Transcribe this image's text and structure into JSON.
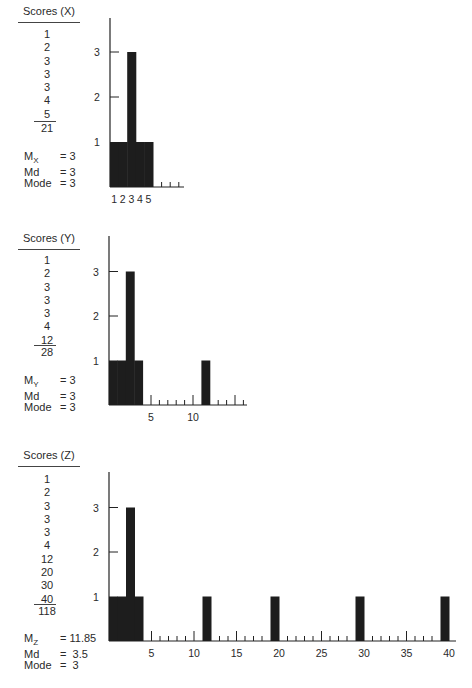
{
  "panels": [
    {
      "id": "x",
      "title": "Scores (X)",
      "scores": [
        "1",
        "2",
        "3",
        "3",
        "3",
        "4",
        "5"
      ],
      "sum": "21",
      "stats": [
        {
          "label": "M",
          "sub": "X",
          "eq": "= 3"
        },
        {
          "label": "Md",
          "sub": "",
          "eq": "= 3"
        },
        {
          "label": "Mode",
          "sub": "",
          "eq": "= 3"
        }
      ]
    },
    {
      "id": "y",
      "title": "Scores (Y)",
      "scores": [
        "1",
        "2",
        "3",
        "3",
        "3",
        "4",
        "12"
      ],
      "sum": "28",
      "stats": [
        {
          "label": "M",
          "sub": "Y",
          "eq": "= 3"
        },
        {
          "label": "Md",
          "sub": "",
          "eq": "= 3"
        },
        {
          "label": "Mode",
          "sub": "",
          "eq": "= 3"
        }
      ]
    },
    {
      "id": "z",
      "title": "Scores (Z)",
      "scores": [
        "1",
        "2",
        "3",
        "3",
        "3",
        "4",
        "12",
        "20",
        "30",
        "40"
      ],
      "sum": "118",
      "stats": [
        {
          "label": "M",
          "sub": "Z",
          "eq": "= 11.85"
        },
        {
          "label": "Md",
          "sub": "",
          "eq": "=  3.5"
        },
        {
          "label": "Mode",
          "sub": "",
          "eq": "=  3"
        }
      ]
    }
  ],
  "chart_data": [
    {
      "type": "bar",
      "title": "Frequency histogram of X",
      "x": [
        1,
        2,
        3,
        4,
        5
      ],
      "values": [
        1,
        1,
        3,
        1,
        1
      ],
      "xlabel": "",
      "ylabel": "",
      "xticklabels": [
        "1",
        "2",
        "3",
        "4",
        "5"
      ],
      "yticklabels": [
        "1",
        "2",
        "3"
      ],
      "xlim": [
        0,
        9
      ],
      "ylim": [
        0,
        3.8
      ],
      "grid": false
    },
    {
      "type": "bar",
      "title": "Frequency histogram of Y",
      "x": [
        1,
        2,
        3,
        4,
        12
      ],
      "values": [
        1,
        1,
        3,
        1,
        1
      ],
      "xlabel": "",
      "ylabel": "",
      "xticklabels": [
        "5",
        "10"
      ],
      "yticklabels": [
        "1",
        "2",
        "3"
      ],
      "xlim": [
        0,
        16
      ],
      "ylim": [
        0,
        3.8
      ],
      "grid": false
    },
    {
      "type": "bar",
      "title": "Frequency histogram of Z",
      "x": [
        1,
        2,
        3,
        4,
        12,
        20,
        30,
        40
      ],
      "values": [
        1,
        1,
        3,
        1,
        1,
        1,
        1,
        1
      ],
      "xlabel": "",
      "ylabel": "",
      "xticklabels": [
        "5",
        "10",
        "15",
        "20",
        "25",
        "30",
        "35",
        "40"
      ],
      "yticklabels": [
        "1",
        "2",
        "3"
      ],
      "xlim": [
        0,
        40.5
      ],
      "ylim": [
        0,
        3.8
      ],
      "grid": false
    }
  ]
}
